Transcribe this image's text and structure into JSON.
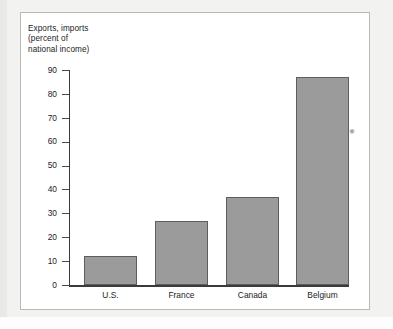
{
  "figure": {
    "title_lines": [
      "Exports, imports",
      "(percent of",
      "national income)"
    ],
    "title_text": "Exports, imports (percent of national income)",
    "artifact": "scan-speck"
  },
  "colors": {
    "bar_fill": "#9b9b9b",
    "bar_border": "#5d5d5d",
    "axis": "#3a3a3a",
    "text": "#1c1c1c",
    "card_background": "#ffffff",
    "page_background": "#f2f2f0",
    "frame_border": "#b9b9b7"
  },
  "chart_data": {
    "type": "bar",
    "xlabel": "",
    "ylabel": "Exports, imports (percent of national income)",
    "categories": [
      "U.S.",
      "France",
      "Canada",
      "Belgium"
    ],
    "values": [
      12,
      27,
      37,
      87
    ],
    "ylim": [
      0,
      90
    ],
    "ytick_labels": [
      "0",
      "10",
      "20",
      "30",
      "40",
      "50",
      "60",
      "70",
      "80",
      "90"
    ],
    "ytick_values": [
      0,
      10,
      20,
      30,
      40,
      50,
      60,
      70,
      80,
      90
    ],
    "grid": false,
    "legend": null
  }
}
